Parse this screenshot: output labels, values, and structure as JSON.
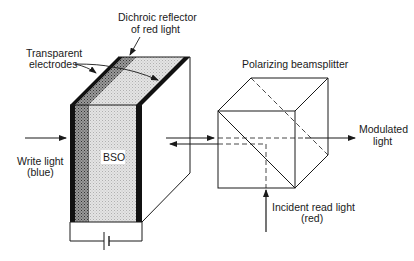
{
  "diagram": {
    "type": "optical-schematic",
    "labels": {
      "dichroic_line1": "Dichroic reflector",
      "dichroic_line2": "of red light",
      "electrodes_line1": "Transparent",
      "electrodes_line2": "electrodes",
      "write_line1": "Write light",
      "write_line2": "(blue)",
      "crystal": "BSO",
      "beamsplitter": "Polarizing beamsplitter",
      "modulated_line1": "Modulated",
      "modulated_line2": "light",
      "read_line1": "Incident read light",
      "read_line2": "(red)"
    },
    "components": [
      {
        "id": "bso-crystal",
        "label": "BSO"
      },
      {
        "id": "transparent-electrodes",
        "label": "Transparent electrodes"
      },
      {
        "id": "dichroic-reflector",
        "label": "Dichroic reflector of red light"
      },
      {
        "id": "polarizing-beamsplitter",
        "label": "Polarizing beamsplitter"
      },
      {
        "id": "battery",
        "label": ""
      }
    ],
    "light_paths": [
      {
        "id": "write-light",
        "color_name": "blue",
        "direction": "right",
        "label": "Write light (blue)"
      },
      {
        "id": "read-light",
        "color_name": "red",
        "direction": "up",
        "label": "Incident read light (red)"
      },
      {
        "id": "modulated-light",
        "direction": "right",
        "label": "Modulated light"
      }
    ],
    "colors": {
      "ink": "#1a1a1a",
      "electrode": "#111111",
      "dichroic_fill": "#8a8a8a",
      "bso_fill": "#d9d9d9",
      "background": "#ffffff"
    }
  }
}
